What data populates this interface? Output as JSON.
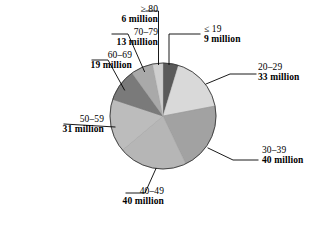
{
  "chart_data": {
    "type": "pie",
    "title": "",
    "subtitle": "",
    "xlabel": "",
    "ylabel": "",
    "legend_position": "none",
    "unit": "million",
    "total": 191,
    "categories": [
      "≤ 19",
      "20–29",
      "30–39",
      "40–49",
      "50–59",
      "60–69",
      "70–79",
      "≥ 80"
    ],
    "values": [
      9,
      33,
      40,
      40,
      31,
      19,
      13,
      6
    ],
    "value_labels": [
      "9 million",
      "33 million",
      "40 million",
      "40 million",
      "31 million",
      "19 million",
      "13 million",
      "6 million"
    ],
    "colors": [
      "#5a5a5a",
      "#d9d9d9",
      "#a2a2a2",
      "#b6b6b6",
      "#bcbcbc",
      "#7a7a7a",
      "#a9a9a9",
      "#cfcfcf"
    ],
    "start_angle_deg": 0,
    "direction": "clockwise",
    "slices": [
      {
        "id": "le19",
        "category": "≤ 19",
        "value": 9,
        "label": "9 million",
        "color": "#5a5a5a"
      },
      {
        "id": "20-29",
        "category": "20–29",
        "value": 33,
        "label": "33 million",
        "color": "#d9d9d9"
      },
      {
        "id": "30-39",
        "category": "30–39",
        "value": 40,
        "label": "40 million",
        "color": "#a2a2a2"
      },
      {
        "id": "40-49",
        "category": "40–49",
        "value": 40,
        "label": "40 million",
        "color": "#b6b6b6"
      },
      {
        "id": "50-59",
        "category": "50–59",
        "value": 31,
        "label": "31 million",
        "color": "#bcbcbc"
      },
      {
        "id": "60-69",
        "category": "60–69",
        "value": 19,
        "label": "19 million",
        "color": "#7a7a7a"
      },
      {
        "id": "70-79",
        "category": "70–79",
        "value": 13,
        "label": "13 million",
        "color": "#a9a9a9"
      },
      {
        "id": "ge80",
        "category": "≥ 80",
        "value": 6,
        "label": "6 million",
        "color": "#cfcfcf"
      }
    ]
  },
  "labels": {
    "le19": {
      "category": "≤ 19",
      "value": "9 million"
    },
    "c20_29": {
      "category": "20–29",
      "value": "33 million"
    },
    "c30_39": {
      "category": "30–39",
      "value": "40 million"
    },
    "c40_49": {
      "category": "40–49",
      "value": "40 million"
    },
    "c50_59": {
      "category": "50–59",
      "value": "31 million"
    },
    "c60_69": {
      "category": "60–69",
      "value": "19 million"
    },
    "c70_79": {
      "category": "70–79",
      "value": "13 million"
    },
    "ge80": {
      "category": "≥ 80",
      "value": "6 million"
    }
  },
  "style": {
    "background": "#ffffff",
    "outline": "#000000",
    "leader_line": "#000000"
  }
}
